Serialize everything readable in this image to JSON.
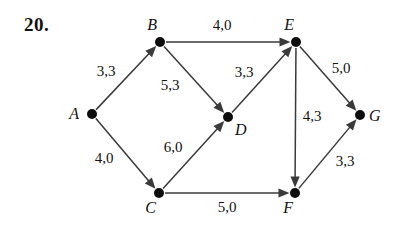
{
  "problem": {
    "number": "20."
  },
  "graph": {
    "nodes": [
      {
        "id": "A",
        "label": "A",
        "x": 92,
        "y": 114,
        "label_dx": -13,
        "label_dy": 5
      },
      {
        "id": "B",
        "label": "B",
        "x": 160,
        "y": 42,
        "label_dx": -3,
        "label_dy": -12
      },
      {
        "id": "C",
        "label": "C",
        "x": 159,
        "y": 193,
        "label_dx": -3,
        "label_dy": 20
      },
      {
        "id": "D",
        "label": "D",
        "x": 228,
        "y": 117,
        "label_dx": 7,
        "label_dy": 18
      },
      {
        "id": "E",
        "label": "E",
        "x": 296,
        "y": 42,
        "label_dx": -2,
        "label_dy": -12
      },
      {
        "id": "F",
        "label": "F",
        "x": 295,
        "y": 193,
        "label_dx": -2,
        "label_dy": 20
      },
      {
        "id": "G",
        "label": "G",
        "x": 360,
        "y": 115,
        "label_dx": 9,
        "label_dy": 6
      }
    ],
    "edges": [
      {
        "from": "A",
        "to": "B",
        "label": "3,3",
        "capacity": 3,
        "flow": 3,
        "label_x": 106,
        "label_y": 76
      },
      {
        "from": "A",
        "to": "C",
        "label": "4,0",
        "capacity": 4,
        "flow": 0,
        "label_x": 104,
        "label_y": 163
      },
      {
        "from": "B",
        "to": "E",
        "label": "4,0",
        "capacity": 4,
        "flow": 0,
        "label_x": 222,
        "label_y": 30
      },
      {
        "from": "B",
        "to": "D",
        "label": "5,3",
        "capacity": 5,
        "flow": 3,
        "label_x": 170,
        "label_y": 90
      },
      {
        "from": "C",
        "to": "D",
        "label": "6,0",
        "capacity": 6,
        "flow": 0,
        "label_x": 173,
        "label_y": 152
      },
      {
        "from": "C",
        "to": "F",
        "label": "5,0",
        "capacity": 5,
        "flow": 0,
        "label_x": 227,
        "label_y": 212
      },
      {
        "from": "D",
        "to": "E",
        "label": "3,3",
        "capacity": 3,
        "flow": 3,
        "label_x": 244,
        "label_y": 77
      },
      {
        "from": "E",
        "to": "G",
        "label": "5,0",
        "capacity": 5,
        "flow": 0,
        "label_x": 341,
        "label_y": 73
      },
      {
        "from": "E",
        "to": "F",
        "label": "4,3",
        "capacity": 4,
        "flow": 3,
        "label_x": 312,
        "label_y": 121
      },
      {
        "from": "F",
        "to": "G",
        "label": "3,3",
        "capacity": 3,
        "flow": 3,
        "label_x": 345,
        "label_y": 166
      }
    ]
  },
  "style": {
    "node_radius": 5,
    "edge_color": "#3a3a3a",
    "node_color": "#0d0d0d",
    "text_color": "#111111",
    "background": "#ffffff"
  }
}
